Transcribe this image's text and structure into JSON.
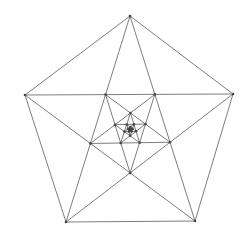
{
  "diagram": {
    "type": "nested-pentagram",
    "outer_pentagon": [
      {
        "name": "top",
        "x": 130,
        "y": 16
      },
      {
        "name": "right",
        "x": 233,
        "y": 94
      },
      {
        "name": "bottom-right",
        "x": 195,
        "y": 221
      },
      {
        "name": "bottom-left",
        "x": 66,
        "y": 222
      },
      {
        "name": "left",
        "x": 25,
        "y": 95
      }
    ],
    "nesting_levels": 7,
    "dot_radius": 1.3,
    "stroke_color": "#6e6e6e",
    "dot_color": "#444444",
    "background": "#ffffff"
  }
}
